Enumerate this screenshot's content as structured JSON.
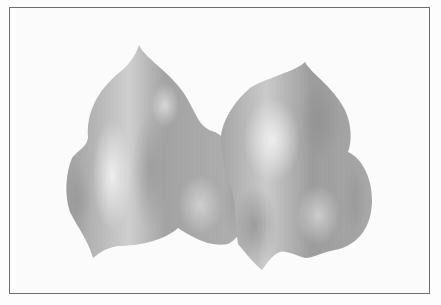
{
  "image": {
    "description": "Grayscale painting of two rounded, pointed gourd-like shapes side by side inside a thin rectangular frame",
    "colors": {
      "background": "#fbfbfb",
      "frame": "#6e6e6e",
      "shape_dark": "#8c8c8c",
      "shape_mid": "#a8a8a8",
      "shape_light": "#e2e2e2"
    }
  }
}
